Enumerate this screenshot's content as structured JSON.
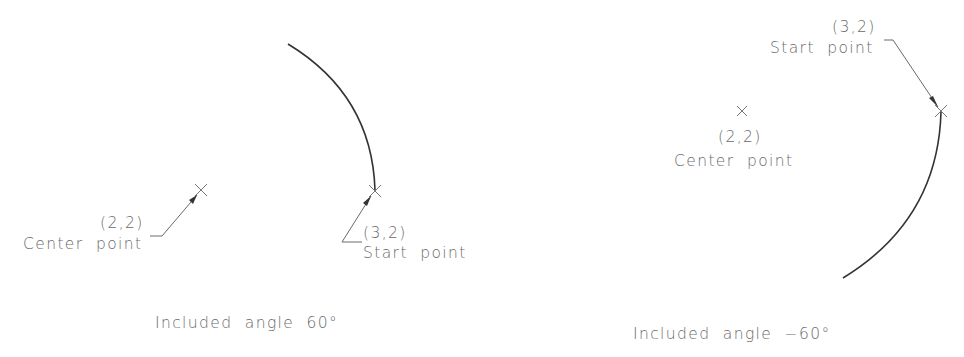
{
  "figures": [
    {
      "id": "positive-angle",
      "center_point": {
        "coord_label": "(2,2)",
        "name_label": "Center point"
      },
      "start_point": {
        "coord_label": "(3,2)",
        "name_label": "Start point"
      },
      "caption": "Included angle 60°",
      "included_angle": 60
    },
    {
      "id": "negative-angle",
      "center_point": {
        "coord_label": "(2,2)",
        "name_label": "Center point"
      },
      "start_point": {
        "coord_label": "(3,2)",
        "name_label": "Start point"
      },
      "caption": "Included angle −60°",
      "included_angle": -60
    }
  ],
  "colors": {
    "geometry": "#333333",
    "text": "#6a6a6a",
    "background": "#ffffff"
  }
}
